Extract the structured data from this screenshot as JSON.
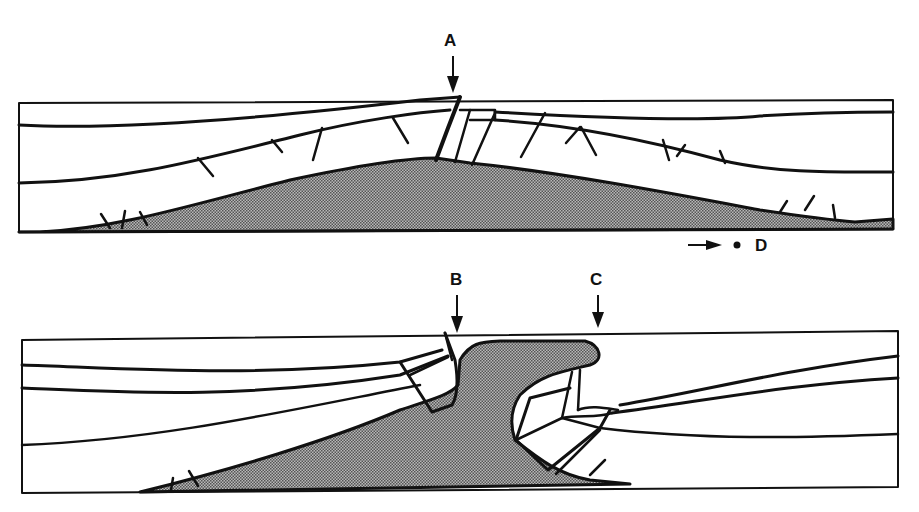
{
  "figure": {
    "panels": [
      {
        "id": "upper",
        "description": "Anticline cross-section with intrusive core (stippled) and fractured strata",
        "marker": "A"
      },
      {
        "id": "lower",
        "description": "Cross-section with intrusion breaching strata between markers",
        "markers": [
          "B",
          "C"
        ]
      }
    ],
    "labels": {
      "a": "A",
      "b": "B",
      "c": "C",
      "d": "D"
    },
    "legend": {
      "arrow_to_point": "D"
    },
    "colors": {
      "line": "#111111",
      "fill_stipple": "#8a8a8a",
      "background": "#ffffff"
    }
  }
}
